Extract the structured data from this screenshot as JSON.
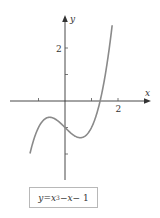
{
  "figure": {
    "x_axis_label": "x",
    "y_axis_label": "y",
    "x_tick_label": "2",
    "y_tick_label": "2",
    "equation": {
      "lhs": "y",
      "eq": " = ",
      "var": "x",
      "exp": "3",
      "rest_minus1": " − ",
      "var2": "x",
      "rest_minus2": " − 1"
    },
    "curve_color": "#8a8a8a",
    "axis_color": "#333333"
  },
  "chart_data": {
    "type": "line",
    "title": "",
    "function": "y = x^3 - x - 1",
    "xlabel": "x",
    "ylabel": "y",
    "x_ticks": [
      -1,
      1,
      2
    ],
    "y_ticks": [
      -2,
      -1,
      1,
      2
    ],
    "labeled_ticks": {
      "x": [
        2
      ],
      "y": [
        2
      ]
    },
    "xlim": [
      -2.4,
      2.8
    ],
    "ylim": [
      -3.2,
      3.3
    ],
    "series": [
      {
        "name": "y = x^3 - x - 1",
        "x": [
          -1.3,
          -1.0,
          -0.577,
          0.0,
          0.577,
          1.0,
          1.325,
          1.5,
          1.75
        ],
        "values": [
          -2.897,
          -1.0,
          -0.615,
          -1.0,
          -1.385,
          -1.0,
          0.0,
          0.875,
          2.609
        ]
      }
    ],
    "grid": false,
    "legend": "none"
  }
}
